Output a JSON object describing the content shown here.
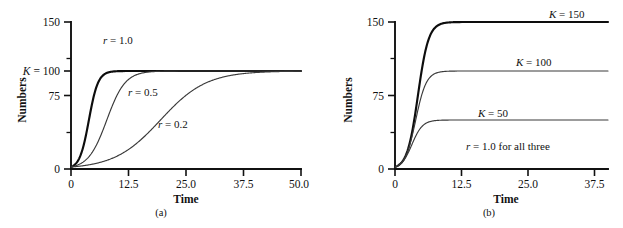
{
  "figure": {
    "background": "#ffffff",
    "ink": "#111111"
  },
  "panels": [
    {
      "id": "a",
      "caption": "(a)",
      "xlabel": "Time",
      "ylabel": "Numbers",
      "klabel": "K = 100",
      "xticks": [
        "0",
        "12.5",
        "25.0",
        "37.5",
        "50.0"
      ],
      "yticks": [
        "0",
        "75",
        "150"
      ],
      "curve_labels": [
        "r = 1.0",
        "r = 0.5",
        "r = 0.2"
      ]
    },
    {
      "id": "b",
      "caption": "(b)",
      "xlabel": "Time",
      "ylabel": "Numbers",
      "xticks": [
        "0",
        "12.5",
        "25.0",
        "37.5"
      ],
      "yticks": [
        "0",
        "75",
        "150"
      ],
      "curve_labels": [
        "K = 150",
        "K = 100",
        "K = 50"
      ],
      "note": "r = 1.0 for all three"
    }
  ],
  "chart_data": [
    {
      "type": "line",
      "panel": "a",
      "title": "",
      "xlabel": "Time",
      "ylabel": "Numbers",
      "xlim": [
        0,
        50
      ],
      "ylim": [
        0,
        150
      ],
      "xticks": [
        0,
        12.5,
        25.0,
        37.5,
        50.0
      ],
      "yticks": [
        0,
        75,
        150
      ],
      "yticks_extra": [
        100
      ],
      "grid": false,
      "legend": "inline-annotations",
      "model": "logistic N(t) = K / (1 + ((K - N0)/N0) * exp(-r*t))",
      "K": 100,
      "N0": 2,
      "series": [
        {
          "name": "r = 1.0",
          "r": 1.0,
          "K": 100,
          "N0": 2,
          "linewidth": "thick",
          "label_x": 9.5,
          "label_y": 112,
          "x": [
            0,
            2,
            4,
            5,
            6,
            7,
            8,
            9,
            10,
            12,
            15,
            20,
            30,
            40,
            50
          ],
          "y": [
            2,
            12.9,
            52.6,
            73.1,
            87.0,
            94.2,
            97.6,
            99.1,
            99.6,
            99.9,
            100,
            100,
            100,
            100,
            100
          ]
        },
        {
          "name": "r = 0.5",
          "r": 0.5,
          "K": 100,
          "N0": 2,
          "linewidth": "thin",
          "label_x": 12.2,
          "label_y": 70,
          "x": [
            0,
            2,
            4,
            6,
            8,
            10,
            12,
            14,
            16,
            18,
            20,
            25,
            30,
            40,
            50
          ],
          "y": [
            2,
            5.3,
            13.1,
            29.0,
            52.6,
            73.1,
            87.0,
            94.2,
            97.6,
            99.1,
            99.6,
            99.97,
            100,
            100,
            100
          ]
        },
        {
          "name": "r = 0.2",
          "r": 0.2,
          "K": 100,
          "N0": 2,
          "linewidth": "thin",
          "label_x": 25.5,
          "label_y": 33,
          "x": [
            0,
            5,
            10,
            15,
            20,
            25,
            30,
            33,
            36,
            40,
            45,
            50
          ],
          "y": [
            2,
            5.3,
            13.1,
            29.0,
            52.6,
            73.1,
            87.0,
            91.8,
            95.0,
            97.6,
            99.1,
            99.6
          ]
        }
      ]
    },
    {
      "type": "line",
      "panel": "b",
      "title": "",
      "xlabel": "Time",
      "ylabel": "Numbers",
      "xlim": [
        0,
        40
      ],
      "ylim": [
        0,
        150
      ],
      "xticks": [
        0,
        12.5,
        25.0,
        37.5
      ],
      "yticks": [
        0,
        75,
        150
      ],
      "grid": false,
      "legend": "inline-annotations",
      "model": "logistic N(t) = K / (1 + ((K - N0)/N0) * exp(-r*t))",
      "r": 1.0,
      "N0": 2,
      "note": "r = 1.0 for all three",
      "series": [
        {
          "name": "K = 150",
          "r": 1.0,
          "K": 150,
          "N0": 2,
          "linewidth": "thick",
          "label_x": 31,
          "label_y": 158,
          "x": [
            0,
            2,
            4,
            5,
            6,
            7,
            8,
            9,
            10,
            12,
            15,
            20,
            30,
            40
          ],
          "y": [
            2,
            14.1,
            68.6,
            105.3,
            128.0,
            139.9,
            145.6,
            148.1,
            149.2,
            149.9,
            150,
            150,
            150,
            150
          ]
        },
        {
          "name": "K = 100",
          "r": 1.0,
          "K": 100,
          "N0": 2,
          "linewidth": "thin",
          "label_x": 24,
          "label_y": 108,
          "x": [
            0,
            2,
            4,
            5,
            6,
            7,
            8,
            9,
            10,
            12,
            15,
            20,
            30,
            40
          ],
          "y": [
            2,
            12.9,
            52.6,
            73.1,
            87.0,
            94.2,
            97.6,
            99.1,
            99.6,
            99.9,
            100,
            100,
            100,
            100
          ]
        },
        {
          "name": "K = 50",
          "r": 1.0,
          "K": 50,
          "N0": 2,
          "linewidth": "thin",
          "label_x": 20,
          "label_y": 58,
          "x": [
            0,
            2,
            3,
            4,
            5,
            6,
            7,
            8,
            10,
            12,
            15,
            20,
            30,
            40
          ],
          "y": [
            2,
            11.1,
            22.1,
            33.3,
            41.5,
            46.1,
            48.3,
            49.3,
            49.9,
            50,
            50,
            50,
            50,
            50
          ]
        }
      ]
    }
  ]
}
